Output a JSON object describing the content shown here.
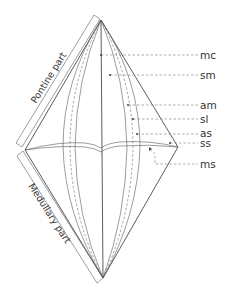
{
  "diagram": {
    "parts": {
      "upper": "Pontine part",
      "lower": "Medullary part"
    },
    "labels": [
      {
        "id": "mc",
        "text": "mc",
        "y": 55
      },
      {
        "id": "sm",
        "text": "sm",
        "y": 75
      },
      {
        "id": "am",
        "text": "am",
        "y": 105
      },
      {
        "id": "sl",
        "text": "sl",
        "y": 119
      },
      {
        "id": "as",
        "text": "as",
        "y": 134
      },
      {
        "id": "ss",
        "text": "ss",
        "y": 143
      },
      {
        "id": "ms",
        "text": "ms",
        "y": 164
      }
    ],
    "colors": {
      "line": "#4a4a4a",
      "background": "#ffffff"
    }
  }
}
